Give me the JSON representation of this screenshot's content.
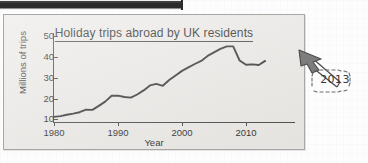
{
  "figure": {
    "title": "Holiday trips abroad by UK residents",
    "annotation_label": "2013",
    "annotation_icon": "hand-drawn-arrow-icon",
    "top_bar_icon": "cut-off-black-bar"
  },
  "chart_data": {
    "type": "line",
    "title": "Holiday trips abroad by UK residents",
    "xlabel": "Year",
    "ylabel": "Millions of trips",
    "xlim": [
      1980,
      2014
    ],
    "ylim": [
      0,
      52
    ],
    "xticks": [
      "1980",
      "1990",
      "2000",
      "2010"
    ],
    "xtick_values": [
      1980,
      1990,
      2000,
      2010
    ],
    "yticks": [
      "10",
      "20",
      "30",
      "40",
      "50"
    ],
    "ytick_values": [
      10,
      20,
      30,
      40,
      50
    ],
    "grid": false,
    "legend": null,
    "line_color": "#3a3a3a",
    "x": [
      1980,
      1981,
      1982,
      1983,
      1984,
      1985,
      1986,
      1987,
      1988,
      1989,
      1990,
      1991,
      1992,
      1993,
      1994,
      1995,
      1996,
      1997,
      1998,
      1999,
      2000,
      2001,
      2002,
      2003,
      2004,
      2005,
      2006,
      2007,
      2008,
      2009,
      2010,
      2011,
      2012,
      2013
    ],
    "values": [
      11.0,
      11.4,
      12.0,
      12.6,
      13.3,
      14.5,
      14.4,
      16.3,
      18.4,
      21.2,
      21.3,
      20.6,
      20.3,
      21.8,
      23.8,
      26.2,
      26.9,
      26.0,
      28.8,
      31.0,
      33.2,
      34.9,
      36.5,
      38.0,
      40.4,
      42.1,
      43.8,
      45.0,
      45.0,
      38.2,
      36.1,
      36.3,
      36.0,
      38.0
    ],
    "annotations": [
      {
        "text": "2013",
        "x": 2013,
        "y": 38.0,
        "style": "hand-drawn-arrow-and-box"
      }
    ]
  }
}
